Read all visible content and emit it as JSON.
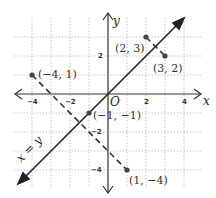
{
  "figure": {
    "axis_labels": {
      "x": "x",
      "y": "y",
      "origin": "O"
    },
    "x_ticks": [
      {
        "value": -4,
        "label": "−4"
      },
      {
        "value": -2,
        "label": "−2"
      },
      {
        "value": 2,
        "label": "2"
      },
      {
        "value": 4,
        "label": "4"
      }
    ],
    "y_ticks": [
      {
        "value": 2,
        "label": "2"
      },
      {
        "value": -2,
        "label": "−2"
      },
      {
        "value": -4,
        "label": "−4"
      }
    ],
    "line_label": "x = y",
    "points": [
      {
        "x": 2,
        "y": 3,
        "label": "(2, 3)"
      },
      {
        "x": 3,
        "y": 2,
        "label": "(3, 2)"
      },
      {
        "x": -4,
        "y": 1,
        "label": "(−4, 1)"
      },
      {
        "x": -1,
        "y": -1,
        "label": "(−1, −1)"
      },
      {
        "x": 1,
        "y": -4,
        "label": "(1, −4)"
      }
    ],
    "colors": {
      "axis": "#333333",
      "grid": "#9a9a9a",
      "line": "#222222",
      "point": "#444444"
    }
  }
}
